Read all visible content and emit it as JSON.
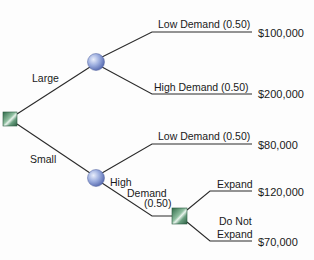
{
  "diagram": {
    "type": "decision-tree",
    "colors": {
      "line": "#2a2a2a",
      "decision_node": "#4e8a66",
      "chance_node": "#7f93cf",
      "text": "#1a1a1a"
    },
    "root": {
      "node_type": "decision",
      "branches": [
        {
          "label": "Large",
          "node_type": "chance",
          "branches": [
            {
              "label": "Low Demand (0.50)",
              "payoff": "$100,000"
            },
            {
              "label": "High Demand (0.50)",
              "payoff": "$200,000"
            }
          ]
        },
        {
          "label": "Small",
          "node_type": "chance",
          "branches": [
            {
              "label": "Low Demand (0.50)",
              "payoff": "$80,000"
            },
            {
              "label_lines": [
                "High",
                "Demand",
                "(0.50)"
              ],
              "node_type": "decision",
              "branches": [
                {
                  "label": "Expand",
                  "payoff": "$120,000"
                },
                {
                  "label_lines": [
                    "Do Not",
                    "Expand"
                  ],
                  "payoff": "$70,000"
                }
              ]
            }
          ]
        }
      ]
    }
  }
}
